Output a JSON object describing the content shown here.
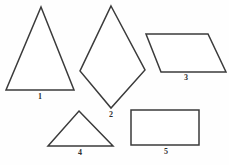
{
  "figure": {
    "background_color": "#fefefe",
    "stroke_color": "#3b3b3b",
    "fill_color": "#ffffff",
    "canvas": {
      "width": 229,
      "height": 165
    }
  },
  "shapes": [
    {
      "id": "shape-1",
      "label": "1",
      "name": "triangle-isosceles-tall",
      "type": "triangle",
      "points": "41,7 74,90 6,90",
      "label_x": 40,
      "label_y": 92
    },
    {
      "id": "shape-2",
      "label": "2",
      "name": "kite-quadrilateral",
      "type": "kite",
      "points": "111,6 145,70 111,108 80,71",
      "label_x": 111,
      "label_y": 110
    },
    {
      "id": "shape-3",
      "label": "3",
      "name": "parallelogram",
      "type": "parallelogram",
      "points": "146,34 208,34 226,72 161,72",
      "label_x": 186,
      "label_y": 73
    },
    {
      "id": "shape-4",
      "label": "4",
      "name": "triangle-isosceles-wide",
      "type": "triangle",
      "points": "79,111 113,146 48,146",
      "label_x": 80,
      "label_y": 148
    },
    {
      "id": "shape-5",
      "label": "5",
      "name": "rectangle",
      "type": "rectangle",
      "points": "131,110 199,110 199,145 131,145",
      "label_x": 166,
      "label_y": 147
    }
  ]
}
